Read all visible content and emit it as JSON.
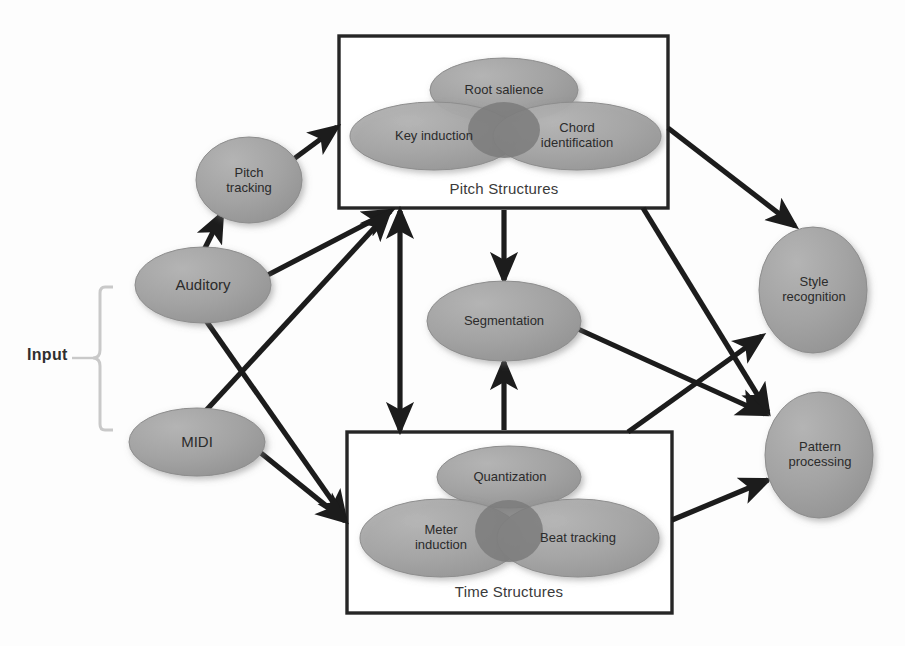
{
  "diagram": {
    "colors": {
      "ellipse_fill": "#9e9e9e",
      "ellipse_fill_light": "#a9a9a9",
      "ellipse_overlap": "#7d7d7d",
      "ellipse_stroke": "#8a8a8a",
      "box_stroke": "#262626",
      "arrow": "#1c1c1c",
      "brace": "#c8c8c8",
      "text": "#2b2b2b",
      "background": "#fdfdfd"
    },
    "input_label": "Input",
    "nodes": [
      {
        "id": "pitch-tracking",
        "label": "Pitch\ntracking"
      },
      {
        "id": "auditory",
        "label": "Auditory"
      },
      {
        "id": "midi",
        "label": "MIDI"
      },
      {
        "id": "segmentation",
        "label": "Segmentation"
      },
      {
        "id": "style-recognition",
        "label": "Style\nrecognition"
      },
      {
        "id": "pattern-processing",
        "label": "Pattern\nprocessing"
      }
    ],
    "groups": [
      {
        "id": "pitch-structures",
        "caption": "Pitch Structures",
        "members": [
          {
            "id": "root-salience",
            "label": "Root salience"
          },
          {
            "id": "key-induction",
            "label": "Key induction"
          },
          {
            "id": "chord-identification",
            "label": "Chord\nidentification"
          }
        ]
      },
      {
        "id": "time-structures",
        "caption": "Time Structures",
        "members": [
          {
            "id": "quantization",
            "label": "Quantization"
          },
          {
            "id": "meter-induction",
            "label": "Meter\ninduction"
          },
          {
            "id": "beat-tracking",
            "label": "Beat tracking"
          }
        ]
      }
    ],
    "edges": [
      {
        "from": "auditory",
        "to": "pitch-tracking",
        "bidirectional": false
      },
      {
        "from": "pitch-tracking",
        "to": "pitch-structures",
        "bidirectional": false
      },
      {
        "from": "auditory",
        "to": "pitch-structures",
        "bidirectional": false
      },
      {
        "from": "midi",
        "to": "pitch-structures",
        "bidirectional": false
      },
      {
        "from": "auditory",
        "to": "time-structures",
        "bidirectional": false
      },
      {
        "from": "midi",
        "to": "time-structures",
        "bidirectional": false
      },
      {
        "from": "pitch-structures",
        "to": "time-structures",
        "bidirectional": true
      },
      {
        "from": "pitch-structures",
        "to": "segmentation",
        "bidirectional": false
      },
      {
        "from": "time-structures",
        "to": "segmentation",
        "bidirectional": false
      },
      {
        "from": "pitch-structures",
        "to": "style-recognition",
        "bidirectional": false
      },
      {
        "from": "pitch-structures",
        "to": "pattern-processing",
        "bidirectional": false
      },
      {
        "from": "time-structures",
        "to": "style-recognition",
        "bidirectional": false
      },
      {
        "from": "time-structures",
        "to": "pattern-processing",
        "bidirectional": false
      },
      {
        "from": "segmentation",
        "to": "pattern-processing",
        "bidirectional": false
      }
    ]
  }
}
